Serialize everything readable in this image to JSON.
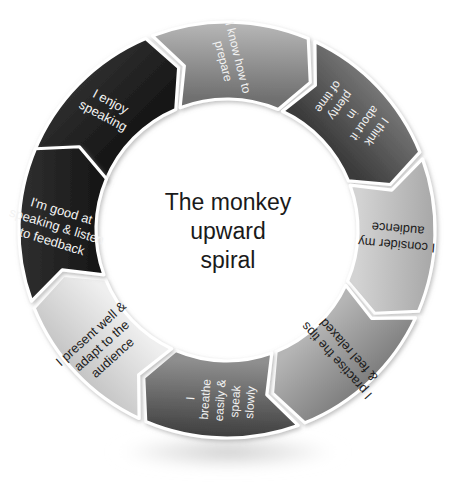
{
  "diagram": {
    "type": "cycle",
    "center_title_lines": [
      "The monkey",
      "upward",
      "spiral"
    ],
    "segment_count": 8,
    "colors": {
      "dark": "#1f1f1f",
      "mid_dark": "#4d4d4d",
      "mid": "#8c8c8c",
      "light": "#d9d9d9",
      "very_light": "#ececec",
      "separator": "#ffffff",
      "text_light": "#f2f2f2",
      "text_dark": "#1c1c1c",
      "background": "#ffffff"
    },
    "segments": [
      {
        "id": "i-enjoy-speaking",
        "lines": [
          "I enjoy",
          "speaking"
        ],
        "tone": "dark",
        "text_color": "light",
        "fill_start": "#151515",
        "fill_end": "#2e2e2e",
        "angle_start": -68,
        "angle_end": -23,
        "label_angle": -45,
        "label_rotation": 28,
        "font_size": 13
      },
      {
        "id": "i-know-how-to-prepare",
        "lines": [
          "I know how to",
          "prepare"
        ],
        "tone": "mid",
        "text_color": "light",
        "fill_start": "#6f6f6f",
        "fill_end": "#b8b8b8",
        "angle_start": -21,
        "angle_end": 23,
        "label_angle": 1,
        "label_rotation": 76,
        "font_size": 12
      },
      {
        "id": "i-think-about-it-in-plenty-of-time",
        "lines": [
          "I think",
          "about it",
          "in",
          "plenty",
          "of time"
        ],
        "tone": "mid_dark",
        "text_color": "light",
        "fill_start": "#3a3a3a",
        "fill_end": "#777777",
        "angle_start": 25,
        "angle_end": 68,
        "label_angle": 47,
        "label_rotation": 126,
        "font_size": 12
      },
      {
        "id": "i-consider-my-audience",
        "lines": [
          "I consider my",
          "audience"
        ],
        "tone": "light",
        "text_color": "dark",
        "fill_start": "#d3d3d3",
        "fill_end": "#a7a7a7",
        "angle_start": 70,
        "angle_end": 113,
        "label_angle": 92,
        "label_rotation": 185,
        "font_size": 13
      },
      {
        "id": "i-practise-the-tips-and-feel-relaxed",
        "lines": [
          "I practise the tips",
          "& feel relaxed"
        ],
        "tone": "mid",
        "text_color": "dark",
        "fill_start": "#b5b5b5",
        "fill_end": "#7d7d7d",
        "angle_start": 115,
        "angle_end": 158,
        "label_angle": 137,
        "label_rotation": 228,
        "font_size": 13
      },
      {
        "id": "i-breathe-easily-and-speak-slowly",
        "lines": [
          "I",
          "breathe",
          "easily &",
          "speak",
          "slowly"
        ],
        "tone": "mid_dark",
        "text_color": "light",
        "fill_start": "#8f8f8f",
        "fill_end": "#3d3d3d",
        "angle_start": 160,
        "angle_end": 203,
        "label_angle": 182,
        "label_rotation": 274,
        "font_size": 12
      },
      {
        "id": "i-present-well-and-adapt-to-the-audience",
        "lines": [
          "I present well &",
          "adapt to the",
          "audience"
        ],
        "tone": "very_light",
        "text_color": "dark",
        "fill_start": "#efefef",
        "fill_end": "#c4c4c4",
        "angle_start": 205,
        "angle_end": 248,
        "label_angle": 227,
        "label_rotation": 318,
        "font_size": 13
      },
      {
        "id": "im-good-at-speaking-and-listen-to-feedback",
        "lines": [
          "I'm good at",
          "speaking & listen",
          "to feedback"
        ],
        "tone": "dark",
        "text_color": "light",
        "fill_start": "#171717",
        "fill_end": "#303030",
        "angle_start": 250,
        "angle_end": 293,
        "label_angle": 271,
        "label_rotation": 17,
        "font_size": 13
      }
    ],
    "geometry": {
      "center_x": 227,
      "center_y": 230,
      "outer_radius": 208,
      "inner_radius": 131,
      "chevron_depth": 19
    }
  }
}
